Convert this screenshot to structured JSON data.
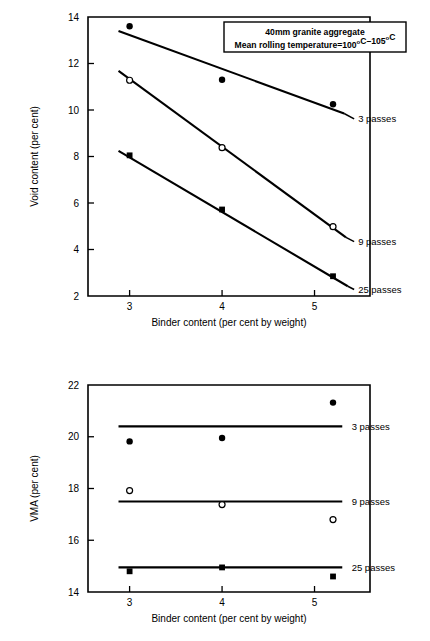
{
  "figures": [
    {
      "id": "void-content",
      "name": "void-content-chart",
      "chart_ref": 0
    },
    {
      "id": "vma",
      "name": "vma-chart",
      "chart_ref": 1
    }
  ],
  "chart_data": [
    {
      "type": "scatter",
      "title": "",
      "xlabel": "Binder content (per cent by weight)",
      "ylabel": "Void content (per cent)",
      "xlim": [
        2.55,
        5.6
      ],
      "ylim": [
        2,
        14
      ],
      "xticks": [
        3,
        4,
        5
      ],
      "xticklabels": [
        "3",
        "4",
        "5"
      ],
      "yticks": [
        2,
        4,
        6,
        8,
        10,
        12,
        14
      ],
      "yticklabels": [
        "2",
        "4",
        "6",
        "8",
        "10",
        "12",
        "14"
      ],
      "grid": false,
      "legend_position": "top-right",
      "annotation": {
        "line1": "40mm granite aggregate",
        "line2_a": "Mean rolling temperature=100",
        "line2_sup1": "o",
        "line2_b": "C",
        "line2_dash": "–",
        "line2_c": "105",
        "line2_sup2": "o",
        "line2_d": "C"
      },
      "series": [
        {
          "name": "3 passes",
          "label": "3 passes",
          "marker": "filled-circle",
          "points": [
            {
              "x": 3.0,
              "y": 13.6
            },
            {
              "x": 4.0,
              "y": 11.3
            },
            {
              "x": 5.2,
              "y": 10.25
            }
          ],
          "fit_line": [
            {
              "x": 2.88,
              "y": 13.4
            },
            {
              "x": 5.32,
              "y": 9.85
            }
          ],
          "label_anchor": {
            "x": 5.45,
            "y": 9.62
          }
        },
        {
          "name": "9 passes",
          "label": "9 passes",
          "marker": "open-circle",
          "points": [
            {
              "x": 3.0,
              "y": 11.28
            },
            {
              "x": 4.0,
              "y": 8.38
            },
            {
              "x": 5.2,
              "y": 4.98
            }
          ],
          "fit_line": [
            {
              "x": 2.88,
              "y": 11.68
            },
            {
              "x": 5.34,
              "y": 4.52
            }
          ],
          "label_anchor": {
            "x": 5.45,
            "y": 4.34
          }
        },
        {
          "name": "25 passes",
          "label": "25 passes",
          "marker": "filled-square",
          "points": [
            {
              "x": 3.0,
              "y": 8.05
            },
            {
              "x": 4.0,
              "y": 5.72
            },
            {
              "x": 5.2,
              "y": 2.85
            }
          ],
          "fit_line": [
            {
              "x": 2.88,
              "y": 8.24
            },
            {
              "x": 5.36,
              "y": 2.42
            }
          ],
          "label_anchor": {
            "x": 5.45,
            "y": 2.28
          }
        }
      ]
    },
    {
      "type": "scatter",
      "title": "",
      "xlabel": "Binder content (per cent by weight)",
      "ylabel": "VMA (per cent)",
      "xlim": [
        2.55,
        5.6
      ],
      "ylim": [
        14,
        22
      ],
      "xticks": [
        3,
        4,
        5
      ],
      "xticklabels": [
        "3",
        "4",
        "5"
      ],
      "yticks": [
        14,
        16,
        18,
        20,
        22
      ],
      "yticklabels": [
        "14",
        "16",
        "18",
        "20",
        "22"
      ],
      "grid": false,
      "legend_position": "right-inline",
      "series": [
        {
          "name": "3 passes",
          "label": "3 passes",
          "marker": "filled-circle",
          "points": [
            {
              "x": 3.0,
              "y": 19.82
            },
            {
              "x": 4.0,
              "y": 19.95
            },
            {
              "x": 5.2,
              "y": 21.32
            }
          ],
          "fit_line": [
            {
              "x": 2.88,
              "y": 20.4
            },
            {
              "x": 5.3,
              "y": 20.4
            }
          ],
          "label_anchor": {
            "x": 5.38,
            "y": 20.4
          }
        },
        {
          "name": "9 passes",
          "label": "9 passes",
          "marker": "open-circle",
          "points": [
            {
              "x": 3.0,
              "y": 17.92
            },
            {
              "x": 4.0,
              "y": 17.38
            },
            {
              "x": 5.2,
              "y": 16.8
            }
          ],
          "fit_line": [
            {
              "x": 2.88,
              "y": 17.5
            },
            {
              "x": 5.3,
              "y": 17.5
            }
          ],
          "label_anchor": {
            "x": 5.38,
            "y": 17.5
          }
        },
        {
          "name": "25 passes",
          "label": "25 passes",
          "marker": "filled-square",
          "points": [
            {
              "x": 3.0,
              "y": 14.8
            },
            {
              "x": 4.0,
              "y": 14.95
            },
            {
              "x": 5.2,
              "y": 14.6
            }
          ],
          "fit_line": [
            {
              "x": 2.88,
              "y": 14.95
            },
            {
              "x": 5.3,
              "y": 14.95
            }
          ],
          "label_anchor": {
            "x": 5.38,
            "y": 14.95
          }
        }
      ]
    }
  ],
  "colors": {
    "ink": "#000000",
    "paper": "#ffffff"
  }
}
